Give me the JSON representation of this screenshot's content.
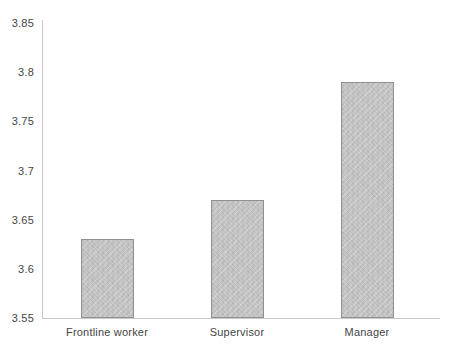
{
  "chart_data": {
    "type": "bar",
    "title": "",
    "xlabel": "",
    "ylabel": "",
    "categories": [
      "Frontline worker",
      "Supervisor",
      "Manager"
    ],
    "values": [
      3.63,
      3.67,
      3.79
    ],
    "ylim": [
      3.55,
      3.85
    ],
    "ytick_step": 0.05,
    "ytick_labels": [
      "3.55",
      "3.6",
      "3.65",
      "3.7",
      "3.75",
      "3.8",
      "3.85"
    ],
    "grid": false,
    "legend_position": "none",
    "colors": {
      "background": "#ffffff",
      "bar_fill": "#c6c6c6",
      "bar_border": "#919191",
      "axis_line": "#c9c9c9",
      "text": "#454545"
    }
  }
}
